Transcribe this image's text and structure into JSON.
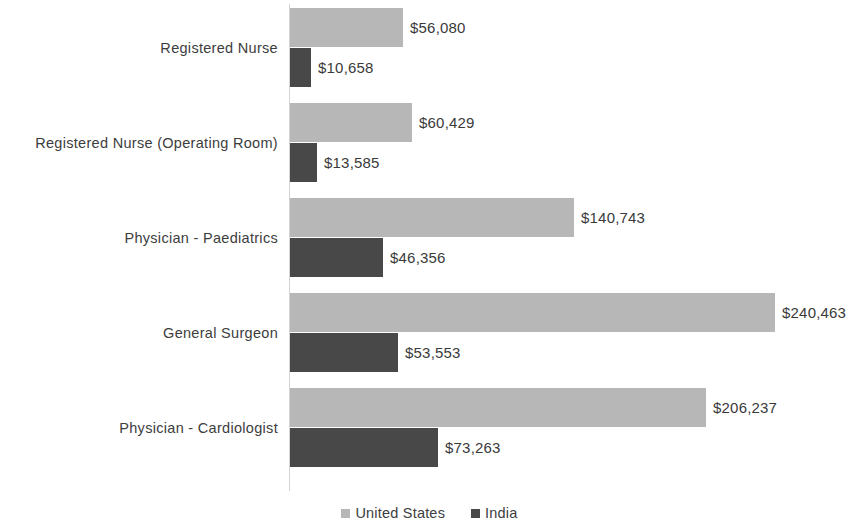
{
  "chart_data": {
    "type": "bar",
    "orientation": "horizontal",
    "title": "",
    "subtitle": "",
    "xlabel": "",
    "ylabel": "",
    "grid": false,
    "legend_position": "bottom",
    "axis_line_color": "#d4d4d4",
    "categories": [
      "Registered Nurse",
      "Registered Nurse (Operating Room)",
      "Physician - Paediatrics",
      "General Surgeon",
      "Physician - Cardiologist"
    ],
    "series": [
      {
        "name": "United States",
        "color": "#b7b7b7",
        "values": [
          56080,
          60429,
          140743,
          240463,
          206237
        ],
        "labels": [
          "$56,080",
          "$60,429",
          "$140,743",
          "$240,463",
          "$206,237"
        ]
      },
      {
        "name": "India",
        "color": "#484848",
        "values": [
          10658,
          13585,
          46356,
          53553,
          73263
        ],
        "labels": [
          "$10,658",
          "$13,585",
          "$46,356",
          "$53,553",
          "$73,263"
        ]
      }
    ],
    "xlim": [
      0,
      240463
    ],
    "value_prefix": "$"
  },
  "legend": {
    "items": [
      {
        "label": "United States",
        "swatch": "legend-swatch-united-states"
      },
      {
        "label": "India",
        "swatch": "legend-swatch-india"
      }
    ]
  }
}
